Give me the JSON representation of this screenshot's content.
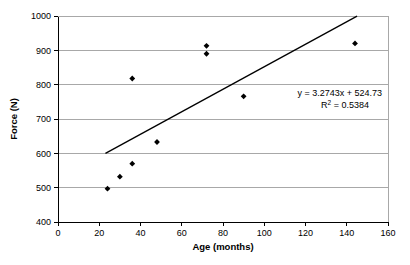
{
  "chart_data": {
    "type": "scatter",
    "title": "",
    "xlabel": "Age (months)",
    "ylabel": "Force (N)",
    "xlim": [
      0,
      160
    ],
    "ylim": [
      400,
      1000
    ],
    "xticks": [
      0,
      20,
      40,
      60,
      80,
      100,
      120,
      140,
      160
    ],
    "yticks": [
      400,
      500,
      600,
      700,
      800,
      900,
      1000
    ],
    "grid": "horizontal",
    "legend": "none",
    "marker": "filled-diamond",
    "marker_color": "#000000",
    "points": [
      {
        "x": 24,
        "y": 497
      },
      {
        "x": 30,
        "y": 532
      },
      {
        "x": 36,
        "y": 570
      },
      {
        "x": 36,
        "y": 818
      },
      {
        "x": 48,
        "y": 633
      },
      {
        "x": 72,
        "y": 913
      },
      {
        "x": 72,
        "y": 890
      },
      {
        "x": 90,
        "y": 766
      },
      {
        "x": 144,
        "y": 920
      }
    ],
    "series": [
      {
        "name": "Force vs Age",
        "x": [
          24,
          30,
          36,
          36,
          48,
          72,
          72,
          90,
          144
        ],
        "values": [
          497,
          532,
          570,
          818,
          633,
          913,
          890,
          766,
          920
        ]
      }
    ],
    "trendline": {
      "type": "linear",
      "slope": 3.2743,
      "intercept": 524.73,
      "r_squared": 0.5384,
      "x_start": 23,
      "x_end": 145,
      "color": "#000000"
    },
    "annotations": {
      "equation": "y = 3.2743x + 524.73",
      "r2_prefix": "R",
      "r2_exponent": "2",
      "r2_value": " = 0.5384"
    },
    "xtick_labels": [
      "0",
      "20",
      "40",
      "60",
      "80",
      "100",
      "120",
      "140",
      "160"
    ],
    "ytick_labels": [
      "400",
      "500",
      "600",
      "700",
      "800",
      "900",
      "1000"
    ],
    "colors": {
      "axis": "#000000",
      "grid": "#a8a8a8",
      "marker": "#000000",
      "trendline": "#000000",
      "background": "#ffffff"
    }
  }
}
